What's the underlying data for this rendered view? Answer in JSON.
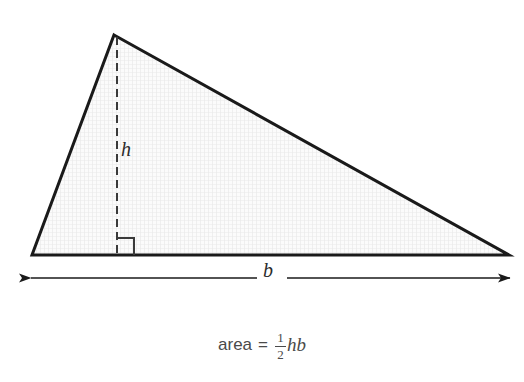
{
  "figure": {
    "background_color": "#ffffff",
    "stroke_color": "#1a1a1a",
    "fill_pattern_color": "#e6e6e6",
    "fill_base_color": "#fbfbfb",
    "labels": {
      "height": "h",
      "base": "b"
    },
    "geometry": {
      "apex": [
        114,
        35
      ],
      "left_vertex": [
        32,
        255
      ],
      "right_vertex": [
        509,
        255
      ],
      "foot_of_height": [
        117,
        255
      ],
      "height_line_top": [
        117,
        37
      ],
      "right_angle_size": 17,
      "dimension_arrow_y": 278,
      "dimension_arrow_x_start": 30,
      "dimension_arrow_x_end": 511
    }
  },
  "formula": {
    "label": "area",
    "equals": "=",
    "fraction_numerator": "1",
    "fraction_denominator": "2",
    "variables": "hb",
    "full_text": "area = 1/2 hb"
  }
}
